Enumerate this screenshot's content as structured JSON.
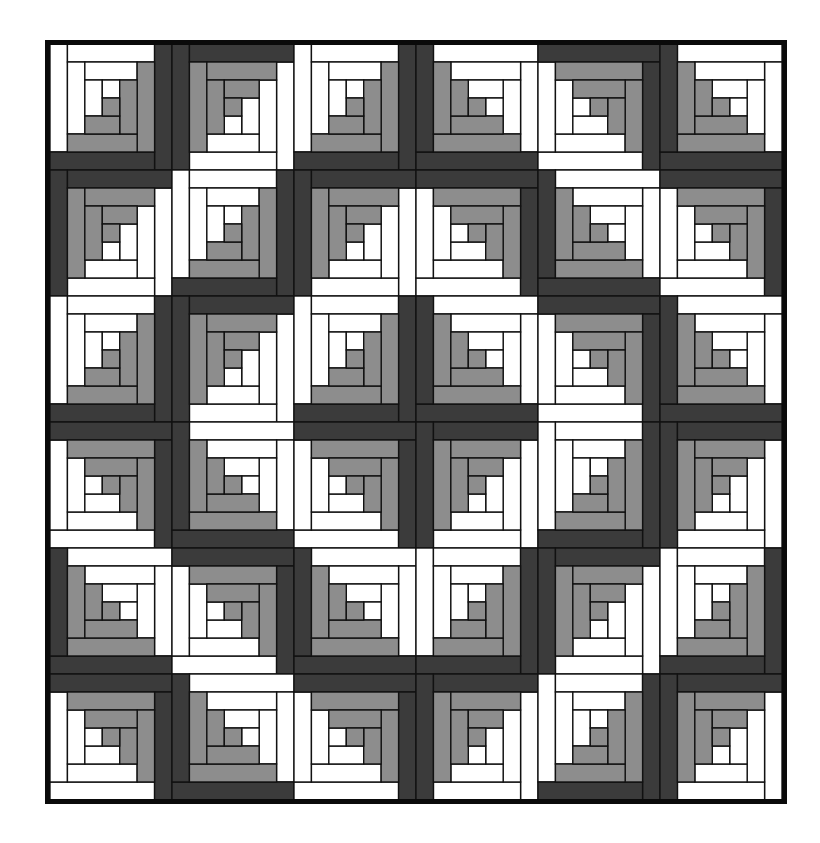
{
  "quilt": {
    "rows": 6,
    "cols": 6,
    "colors": {
      "light": "#ffffff",
      "dark": "#3b3b3b",
      "mid": "#8d8d8d",
      "outline": "#111111",
      "frame": "#0a0a0a"
    },
    "orientation_legend": {
      "BR": "dark outer logs on right and bottom",
      "BL": "dark outer logs on bottom and left",
      "TL": "dark outer logs on top and left",
      "TR": "dark outer logs on top and right"
    },
    "blocks": [
      [
        "BR",
        "TL",
        "BR",
        "BL",
        "TR",
        "BL"
      ],
      [
        "TL",
        "BR",
        "TL",
        "TR",
        "BL",
        "TR"
      ],
      [
        "BR",
        "TL",
        "BR",
        "BL",
        "TR",
        "BL"
      ],
      [
        "TR",
        "BL",
        "TR",
        "TL",
        "BR",
        "TL"
      ],
      [
        "BL",
        "TR",
        "BL",
        "BR",
        "TL",
        "BR"
      ],
      [
        "TR",
        "BL",
        "TR",
        "TL",
        "BR",
        "TL"
      ]
    ]
  }
}
